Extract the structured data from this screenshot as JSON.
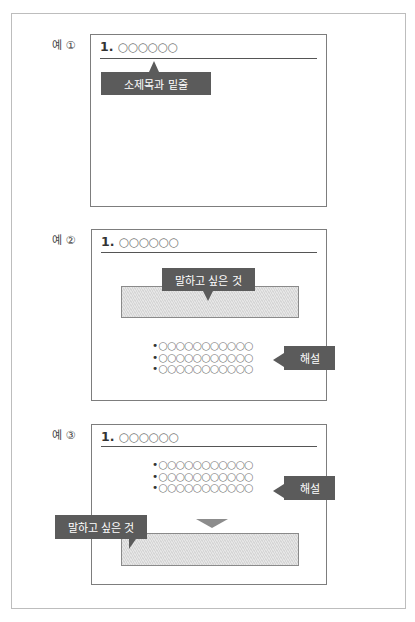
{
  "examples": [
    {
      "label": "예 ①",
      "slide_title_number": "1.",
      "slide_title_text": "○○○○○○",
      "callout": "소제목과 밑줄"
    },
    {
      "label": "예 ②",
      "slide_title_number": "1.",
      "slide_title_text": "○○○○○○",
      "callout_main": "말하고 싶은 것",
      "bullets": [
        "○○○○○○○○○○○",
        "○○○○○○○○○○○",
        "○○○○○○○○○○○"
      ],
      "bullet_marker": "•",
      "callout_side": "해설"
    },
    {
      "label": "예 ③",
      "slide_title_number": "1.",
      "slide_title_text": "○○○○○○",
      "bullets": [
        "○○○○○○○○○○○",
        "○○○○○○○○○○○",
        "○○○○○○○○○○○"
      ],
      "bullet_marker": "•",
      "callout_side": "해설",
      "callout_main": "말하고 싶은 것"
    }
  ],
  "colors": {
    "callout_bg": "#5b5b5b",
    "hatch_box": "#dcdcdc",
    "arrow": "#8c8c8c"
  }
}
